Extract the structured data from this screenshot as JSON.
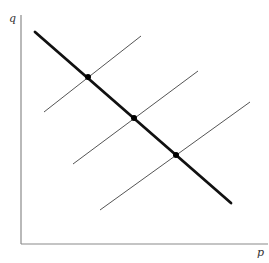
{
  "diagram": {
    "type": "price-quantity diagram",
    "axes": {
      "y_label": "q",
      "x_label": "p",
      "color": "#8a8a8a"
    },
    "thick_line": {
      "x1": 35,
      "y1": 32,
      "x2": 231,
      "y2": 203,
      "color": "#111111",
      "width": 2.8
    },
    "thin_lines": [
      {
        "x1": 44,
        "y1": 112,
        "x2": 141,
        "y2": 36
      },
      {
        "x1": 73,
        "y1": 164,
        "x2": 198,
        "y2": 71
      },
      {
        "x1": 100,
        "y1": 210,
        "x2": 250,
        "y2": 102
      }
    ],
    "thin_line_color": "#555555",
    "intersection_points": [
      {
        "x": 88,
        "y": 77
      },
      {
        "x": 134,
        "y": 118
      },
      {
        "x": 176,
        "y": 155
      }
    ],
    "point_color": "#000000"
  }
}
